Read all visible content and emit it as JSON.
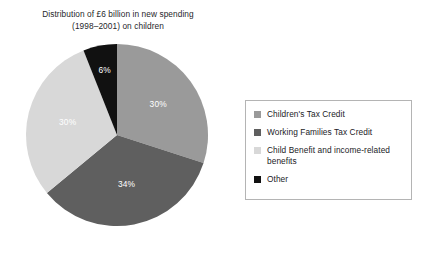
{
  "chart_data": {
    "type": "pie",
    "title": "Distribution of £6 billion in new spending (1998–2001) on children",
    "title_lines": [
      "Distribution of £6 billion in new spending",
      "(1998–2001) on children"
    ],
    "categories": [
      "Children's Tax Credit",
      "Working Families Tax Credit",
      "Child Benefit and income-related benefits",
      "Other"
    ],
    "values": [
      30,
      34,
      30,
      6
    ],
    "value_labels": [
      "30%",
      "34%",
      "30%",
      "6%"
    ],
    "colors": [
      "#9a9a9a",
      "#5f5f5f",
      "#d8d8d8",
      "#111111"
    ],
    "start_angle_deg": 0,
    "direction": "clockwise",
    "legend_position": "right",
    "grid": false,
    "xlabel": "",
    "ylabel": ""
  },
  "legend": {
    "entries": [
      {
        "label": "Children's Tax Credit",
        "color": "#9a9a9a"
      },
      {
        "label": "Working Families Tax Credit",
        "color": "#5f5f5f"
      },
      {
        "label": "Child Benefit and income-related benefits",
        "color": "#d8d8d8"
      },
      {
        "label": "Other",
        "color": "#111111"
      }
    ]
  },
  "pie_geometry": {
    "cx": 92,
    "cy": 92,
    "r": 91
  }
}
